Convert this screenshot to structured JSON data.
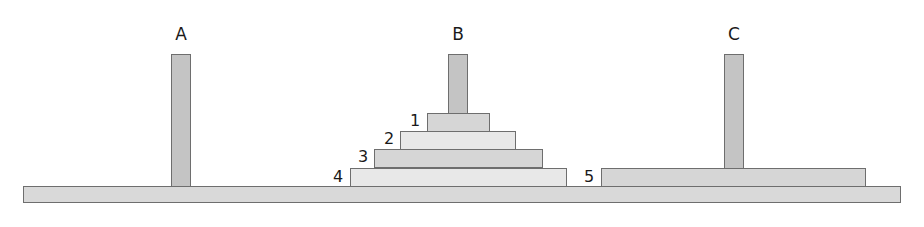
{
  "colors": {
    "outline": "#6e6e6e",
    "peg_fill": "#c4c4c4",
    "base_fill": "#d9d9d9",
    "disc_light": "#e8e8e8",
    "disc_mid": "#d6d6d6"
  },
  "pegs": [
    {
      "label": "A",
      "discs": []
    },
    {
      "label": "B",
      "discs": [
        "1",
        "2",
        "3",
        "4"
      ]
    },
    {
      "label": "C",
      "discs": [
        "5"
      ]
    }
  ],
  "discs": [
    {
      "label": "1",
      "peg": "B"
    },
    {
      "label": "2",
      "peg": "B"
    },
    {
      "label": "3",
      "peg": "B"
    },
    {
      "label": "4",
      "peg": "B"
    },
    {
      "label": "5",
      "peg": "C"
    }
  ]
}
